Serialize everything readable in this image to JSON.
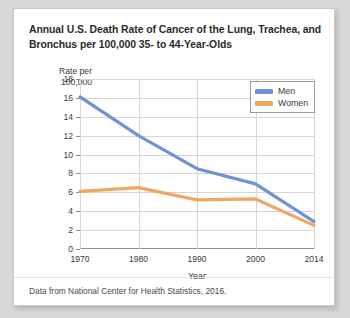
{
  "card": {
    "title_line1": "Annual U.S. Death Rate of Cancer of the Lung, Trachea, and",
    "title_line2": "Bronchus per 100,000 35- to 44-Year-Olds",
    "source_note": "Data from National Center for Health Statistics, 2016.",
    "axis_title_y": "Rate per\n100,000"
  },
  "colors": {
    "men": "#6f93d6",
    "women": "#f0a860",
    "axis": "#8d8d8d",
    "grid": "#d6d6d6",
    "text": "#3a3a3a",
    "title": "#2b2b2b",
    "card_background": "#ffffff",
    "page_background": "#d8d8d6"
  },
  "chart_data": {
    "type": "line",
    "xlabel": "Year",
    "ylabel": "Rate per 100,000",
    "categories": [
      "1970",
      "1980",
      "1990",
      "2000",
      "2014"
    ],
    "x": [
      1970,
      1980,
      1990,
      2000,
      2014
    ],
    "series": [
      {
        "name": "Men",
        "values": [
          16.1,
          12.0,
          8.5,
          6.9,
          2.9
        ],
        "color": "#6f93d6"
      },
      {
        "name": "Women",
        "values": [
          6.1,
          6.5,
          5.2,
          5.3,
          2.5
        ],
        "color": "#f0a860"
      }
    ],
    "ylim": [
      0,
      18
    ],
    "yticks": [
      0,
      2,
      4,
      6,
      8,
      10,
      12,
      14,
      16,
      18
    ],
    "ytick_labels": [
      "0",
      "2",
      "4",
      "6",
      "8",
      "10",
      "12",
      "14",
      "16",
      "18"
    ],
    "xtick_labels": [
      "1970",
      "1980",
      "1990",
      "2000",
      "2014"
    ],
    "grid": true,
    "legend_position": "top-right",
    "legend_entries": [
      "Men",
      "Women"
    ],
    "annotation": "Data from National Center for Health Statistics, 2016."
  }
}
